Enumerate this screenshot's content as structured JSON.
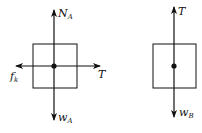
{
  "diagrams": [
    {
      "name": "block-A",
      "forces": {
        "up": {
          "symbol": "N",
          "subscript": "A"
        },
        "down": {
          "symbol": "w",
          "subscript": "A"
        },
        "left": {
          "symbol": "f",
          "subscript": "k"
        },
        "right": {
          "symbol": "T",
          "subscript": ""
        }
      }
    },
    {
      "name": "block-B",
      "forces": {
        "up": {
          "symbol": "T",
          "subscript": ""
        },
        "down": {
          "symbol": "w",
          "subscript": "B"
        }
      }
    }
  ],
  "colors": {
    "line": "#111111",
    "background": "#ffffff"
  }
}
